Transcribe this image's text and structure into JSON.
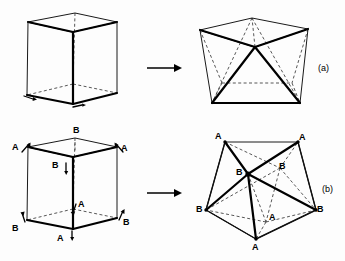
{
  "figure": {
    "background_color": "#fdfdfd",
    "ink_color": "#000000",
    "panels": [
      {
        "id": "a",
        "label": "(a)",
        "x": 318,
        "y": 64
      },
      {
        "id": "b",
        "label": "(b)",
        "x": 322,
        "y": 185
      }
    ],
    "arrows": [
      {
        "id": "arrow-row-a",
        "from_x": 147,
        "to_x": 181,
        "y": 68
      },
      {
        "id": "arrow-row-b",
        "from_x": 147,
        "to_x": 181,
        "y": 193
      }
    ],
    "row_a": {
      "left_shape": "cube",
      "right_shape": "twinned-polyhedron",
      "labels": []
    },
    "row_b": {
      "left_shape": "labelled-cube",
      "right_shape": "labelled-twinned-polyhedron",
      "left_labels": [
        {
          "text": "B",
          "x": 73,
          "y": 126
        },
        {
          "text": "A",
          "x": 12,
          "y": 143
        },
        {
          "text": "A",
          "x": 121,
          "y": 144
        },
        {
          "text": "B",
          "x": 52,
          "y": 161
        },
        {
          "text": "A",
          "x": 78,
          "y": 200
        },
        {
          "text": "B",
          "x": 12,
          "y": 224
        },
        {
          "text": "B",
          "x": 123,
          "y": 218
        },
        {
          "text": "A",
          "x": 57,
          "y": 234
        }
      ],
      "right_labels": [
        {
          "text": "A",
          "x": 215,
          "y": 132
        },
        {
          "text": "A",
          "x": 299,
          "y": 133
        },
        {
          "text": "B",
          "x": 236,
          "y": 168
        },
        {
          "text": "B",
          "x": 279,
          "y": 162
        },
        {
          "text": "B",
          "x": 196,
          "y": 205
        },
        {
          "text": "B",
          "x": 317,
          "y": 205
        },
        {
          "text": "A",
          "x": 269,
          "y": 213
        },
        {
          "text": "A",
          "x": 252,
          "y": 243
        }
      ]
    }
  },
  "geometry": {
    "cube_a": {
      "top_back": [
        75,
        13
      ],
      "top_left": [
        28,
        22
      ],
      "top_right": [
        117,
        22
      ],
      "top_front": [
        73,
        32
      ],
      "bot_back": [
        73,
        84
      ],
      "bot_left": [
        27,
        95
      ],
      "bot_right": [
        117,
        93
      ],
      "bot_front": [
        73,
        104
      ]
    },
    "poly_a": {
      "top_back": [
        252,
        18
      ],
      "top_left": [
        200,
        30
      ],
      "top_right": [
        308,
        29
      ],
      "center": [
        255,
        47
      ],
      "bot_back": [
        257,
        83
      ],
      "bot_left": [
        212,
        103
      ],
      "bot_right": [
        300,
        103
      ],
      "dash_left": [
        222,
        83
      ],
      "dash_right": [
        292,
        83
      ]
    },
    "cube_b": {
      "top_back": [
        75,
        138
      ],
      "top_left": [
        28,
        147
      ],
      "top_right": [
        117,
        147
      ],
      "top_front": [
        73,
        157
      ],
      "bot_back": [
        73,
        209
      ],
      "bot_left": [
        27,
        220
      ],
      "bot_right": [
        117,
        218
      ],
      "bot_front": [
        73,
        229
      ]
    },
    "poly_b": {
      "a_top_left": [
        225,
        142
      ],
      "a_top_right": [
        298,
        142
      ],
      "b_center": [
        248,
        174
      ],
      "b_inner": [
        280,
        168
      ],
      "b_left": [
        206,
        210
      ],
      "b_right": [
        316,
        210
      ],
      "a_inner": [
        266,
        222
      ],
      "a_bottom": [
        256,
        239
      ]
    }
  }
}
